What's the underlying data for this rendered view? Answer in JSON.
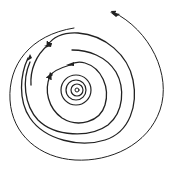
{
  "diagram": {
    "type": "spiral",
    "stroke_color": "#222222",
    "background_color": "#ffffff",
    "center": [
      76,
      90
    ],
    "arrows": [
      {
        "id": "outer-top-right",
        "position": [
          113,
          12
        ],
        "direction": "up-left"
      },
      {
        "id": "mid-upper-left-1",
        "position": [
          48,
          45
        ],
        "direction": "left"
      },
      {
        "id": "mid-upper-left-2",
        "position": [
          28,
          58
        ],
        "direction": "down-left"
      },
      {
        "id": "inner-top",
        "position": [
          70,
          65
        ],
        "direction": "left"
      },
      {
        "id": "inner-left",
        "position": [
          50,
          76
        ],
        "direction": "down"
      }
    ]
  }
}
